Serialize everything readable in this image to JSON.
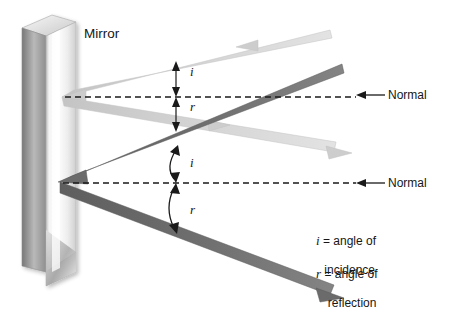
{
  "diagram": {
    "mirror_label": "Mirror",
    "normal_label_top": "Normal",
    "normal_label_bottom": "Normal",
    "angle_labels": {
      "incidence_top": "i",
      "reflection_top": "r",
      "incidence_bottom": "i",
      "reflection_bottom": "r"
    },
    "legend": {
      "incidence": {
        "symbol": "i",
        "equals": " = ",
        "line1": "angle of",
        "line2": "incidence"
      },
      "reflection": {
        "symbol": "r",
        "equals": " = ",
        "line1": "angle of",
        "line2": "reflection"
      }
    },
    "colors": {
      "light_ray": "#cfcfcf",
      "light_ray_edge": "#bdbdbd",
      "dark_ray": "#6e6e6e",
      "dark_ray_edge": "#5d5d5d",
      "normal_line": "#1a1a1a",
      "text": "#161616",
      "mirror_face_light": "#f2f2f2",
      "mirror_face_dark": "#c6c6c6",
      "mirror_edge": "#8d8d8d"
    }
  }
}
